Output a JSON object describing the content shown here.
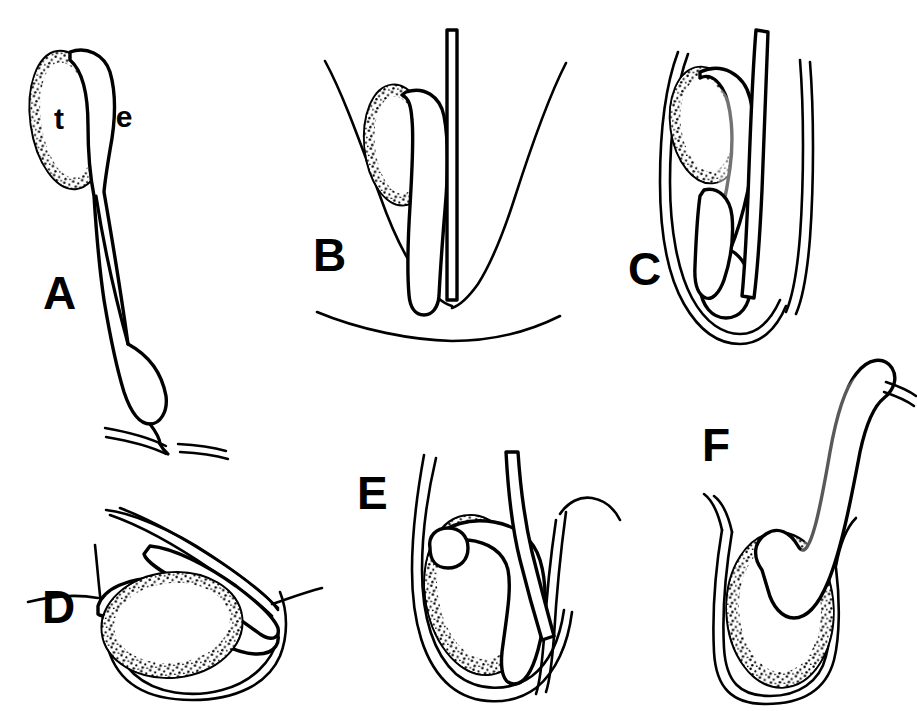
{
  "figure": {
    "background_color": "#ffffff",
    "ink_color": "#000000",
    "style": "black and white stippled line drawing",
    "width": 917,
    "height": 711
  },
  "annotations": [
    {
      "id": "t",
      "label": "t",
      "meaning": "testis",
      "x": 68,
      "y": 129,
      "panel": "A"
    },
    {
      "id": "e",
      "label": "e",
      "meaning": "epididymis",
      "x": 122,
      "y": 127,
      "panel": "A"
    }
  ],
  "panels": [
    {
      "id": "A",
      "label": "A",
      "label_x": 43,
      "label_y": 309,
      "description": "Pendulous testis with long epididymal duct descending to a bulbous cauda that passes an abdominal wall line",
      "parts": [
        "testis",
        "epididymis-head",
        "epididymal-duct",
        "cauda-epididymis",
        "body-wall"
      ]
    },
    {
      "id": "B",
      "label": "B",
      "label_x": 313,
      "label_y": 271,
      "description": "Testis in scrotal pouch with elongate epididymis descending beside a straight vas deferens",
      "parts": [
        "testis",
        "epididymis",
        "vas-deferens",
        "scrotal-sac",
        "body-wall"
      ]
    },
    {
      "id": "C",
      "label": "C",
      "label_x": 628,
      "label_y": 285,
      "description": "Testis enclosed in sac with epididymis curving around its caudal pole and vas deferens ascending",
      "parts": [
        "testis",
        "epididymis",
        "cauda-epididymis",
        "vas-deferens",
        "scrotal-sac"
      ]
    },
    {
      "id": "D",
      "label": "D",
      "label_x": 42,
      "label_y": 623,
      "description": "Horizontally oriented testis with epididymis arching over its dorsal surface inside a sac",
      "parts": [
        "testis",
        "epididymis",
        "vas-deferens",
        "scrotal-sac"
      ]
    },
    {
      "id": "E",
      "label": "E",
      "label_x": 357,
      "label_y": 509,
      "description": "Large ovoid testis with epididymis running along its caudal margin within a descended sac",
      "parts": [
        "testis",
        "epididymis",
        "vas-deferens",
        "scrotal-sac"
      ]
    },
    {
      "id": "F",
      "label": "F",
      "label_x": 702,
      "label_y": 461,
      "description": "Testis in sac with epididymis extending externally upward and hooking to the right",
      "parts": [
        "testis",
        "epididymis",
        "vas-deferens",
        "scrotal-sac"
      ]
    }
  ]
}
